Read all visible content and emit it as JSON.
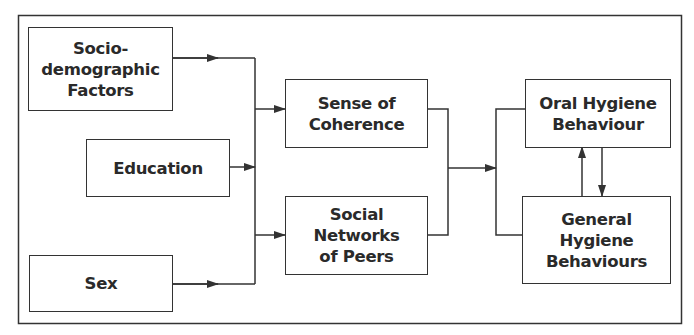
{
  "diagram": {
    "type": "flowchart",
    "nodes": [
      {
        "id": "socio",
        "label": "Socio-\ndemographic\nFactors"
      },
      {
        "id": "education",
        "label": "Education"
      },
      {
        "id": "sex",
        "label": "Sex"
      },
      {
        "id": "soc",
        "label": "Sense of\nCoherence"
      },
      {
        "id": "peers",
        "label": "Social\nNetworks\nof Peers"
      },
      {
        "id": "oral",
        "label": "Oral Hygiene\nBehaviour"
      },
      {
        "id": "general",
        "label": "General\nHygiene\nBehaviours"
      }
    ],
    "edges": [
      {
        "from": "socio",
        "to": "soc"
      },
      {
        "from": "socio",
        "to": "peers"
      },
      {
        "from": "education",
        "to": "soc"
      },
      {
        "from": "education",
        "to": "peers"
      },
      {
        "from": "sex",
        "to": "soc"
      },
      {
        "from": "sex",
        "to": "peers"
      },
      {
        "from": "soc",
        "to": "oral"
      },
      {
        "from": "soc",
        "to": "general"
      },
      {
        "from": "peers",
        "to": "oral"
      },
      {
        "from": "peers",
        "to": "general"
      },
      {
        "from": "oral",
        "to": "general"
      },
      {
        "from": "general",
        "to": "oral"
      }
    ]
  }
}
